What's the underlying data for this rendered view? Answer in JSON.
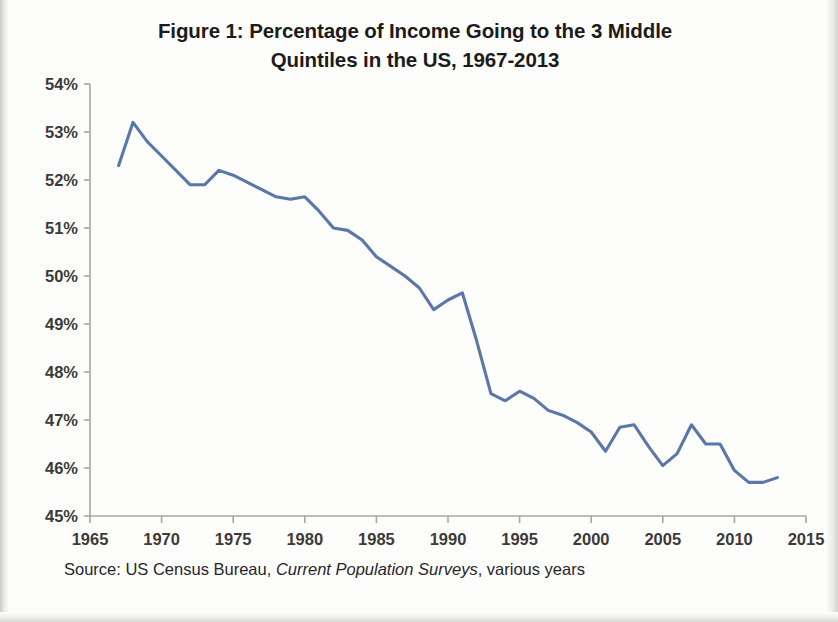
{
  "figure": {
    "title": "Figure 1: Percentage of Income Going to the 3 Middle Quintiles in the US, 1967-2013",
    "title_line_1": "Figure 1: Percentage of Income Going to the 3 Middle",
    "title_line_2": "Quintiles in the US, 1967-2013",
    "source_prefix": "Source:  US Census Bureau,",
    "source_italic": "Current Population Surveys",
    "source_suffix": ", various years",
    "line_color": "#5b76a8",
    "axis_color": "#a6a6a6",
    "text_color": "#231f20"
  },
  "chart_data": {
    "type": "line",
    "title": "Figure 1: Percentage of Income Going to the 3 Middle Quintiles in the US, 1967-2013",
    "xlabel": "",
    "ylabel": "",
    "xlim": [
      1965,
      2015
    ],
    "ylim": [
      45,
      54
    ],
    "grid": false,
    "legend": "none",
    "x_tick_labels": [
      "1965",
      "1970",
      "1975",
      "1980",
      "1985",
      "1990",
      "1995",
      "2000",
      "2005",
      "2010",
      "2015"
    ],
    "x_ticks": [
      1965,
      1970,
      1975,
      1980,
      1985,
      1990,
      1995,
      2000,
      2005,
      2010,
      2015
    ],
    "y_tick_labels": [
      "45%",
      "46%",
      "47%",
      "48%",
      "49%",
      "50%",
      "51%",
      "52%",
      "53%",
      "54%"
    ],
    "y_ticks": [
      45,
      46,
      47,
      48,
      49,
      50,
      51,
      52,
      53,
      54
    ],
    "series": [
      {
        "name": "Share of income to middle three quintiles",
        "x": [
          1967,
          1968,
          1969,
          1970,
          1971,
          1972,
          1973,
          1974,
          1975,
          1976,
          1977,
          1978,
          1979,
          1980,
          1981,
          1982,
          1983,
          1984,
          1985,
          1986,
          1987,
          1988,
          1989,
          1990,
          1991,
          1992,
          1993,
          1994,
          1995,
          1996,
          1997,
          1998,
          1999,
          2000,
          2001,
          2002,
          2003,
          2004,
          2005,
          2006,
          2007,
          2008,
          2009,
          2010,
          2011,
          2012,
          2013
        ],
        "values": [
          52.3,
          53.2,
          52.8,
          52.5,
          52.2,
          51.9,
          51.9,
          52.2,
          52.1,
          51.95,
          51.8,
          51.65,
          51.6,
          51.65,
          51.35,
          51.0,
          50.95,
          50.75,
          50.4,
          50.2,
          50.0,
          49.75,
          49.3,
          49.5,
          49.65,
          48.65,
          47.55,
          47.4,
          47.6,
          47.45,
          47.2,
          47.1,
          46.95,
          46.75,
          46.35,
          46.85,
          46.9,
          46.45,
          46.05,
          46.3,
          46.9,
          46.5,
          46.5,
          45.95,
          45.7,
          45.7,
          45.8
        ]
      }
    ]
  }
}
